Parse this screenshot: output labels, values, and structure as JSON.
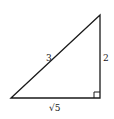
{
  "diagram": {
    "type": "right-triangle",
    "vertices": {
      "left": [
        11,
        98
      ],
      "top": [
        100,
        15
      ],
      "right_angle": [
        100,
        98
      ]
    },
    "sides": {
      "hypotenuse": {
        "label": "3"
      },
      "vertical_leg": {
        "label": "2"
      },
      "horizontal_leg": {
        "label": "√5"
      }
    },
    "right_angle_marker": true,
    "stroke_color": "#1a1a1a",
    "background": "#ffffff"
  }
}
